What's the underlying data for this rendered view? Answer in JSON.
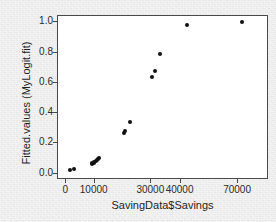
{
  "chart_data": {
    "type": "scatter",
    "title": "",
    "xlabel": "SavingData$Savings",
    "ylabel": "Fitted.values (MyLogit.fit)",
    "grid": false,
    "legend": false,
    "legend_position": "none",
    "point_color": "#101010",
    "panel_background": "#ffffff",
    "frame_color": "#4a4a4a",
    "figure_background": "#ececec",
    "xlim": [
      0,
      75000
    ],
    "ylim": [
      0.0,
      1.0
    ],
    "x_tick_labels": [
      "0",
      "10000",
      "30000",
      "40000",
      "70000"
    ],
    "x_tick_values": [
      0,
      10000,
      30000,
      40000,
      70000
    ],
    "x_tick_positions_pct": [
      2.8,
      16.6,
      44.1,
      58.3,
      86.2
    ],
    "y_tick_labels": [
      "0.0",
      "0.2",
      "0.4",
      "0.6",
      "0.8",
      "1.0"
    ],
    "y_tick_values": [
      0.0,
      0.2,
      0.4,
      0.6,
      0.8,
      1.0
    ],
    "points": [
      {
        "x": 1200,
        "y": 0.022
      },
      {
        "x": 2600,
        "y": 0.03
      },
      {
        "x": 8900,
        "y": 0.062
      },
      {
        "x": 9200,
        "y": 0.068
      },
      {
        "x": 9600,
        "y": 0.073
      },
      {
        "x": 9900,
        "y": 0.078
      },
      {
        "x": 10300,
        "y": 0.083
      },
      {
        "x": 10700,
        "y": 0.089
      },
      {
        "x": 11100,
        "y": 0.095
      },
      {
        "x": 11500,
        "y": 0.101
      },
      {
        "x": 20200,
        "y": 0.268
      },
      {
        "x": 20600,
        "y": 0.279
      },
      {
        "x": 22400,
        "y": 0.343
      },
      {
        "x": 30300,
        "y": 0.638
      },
      {
        "x": 31200,
        "y": 0.676
      },
      {
        "x": 33100,
        "y": 0.791
      },
      {
        "x": 43300,
        "y": 0.985
      },
      {
        "x": 71800,
        "y": 0.999
      }
    ]
  }
}
